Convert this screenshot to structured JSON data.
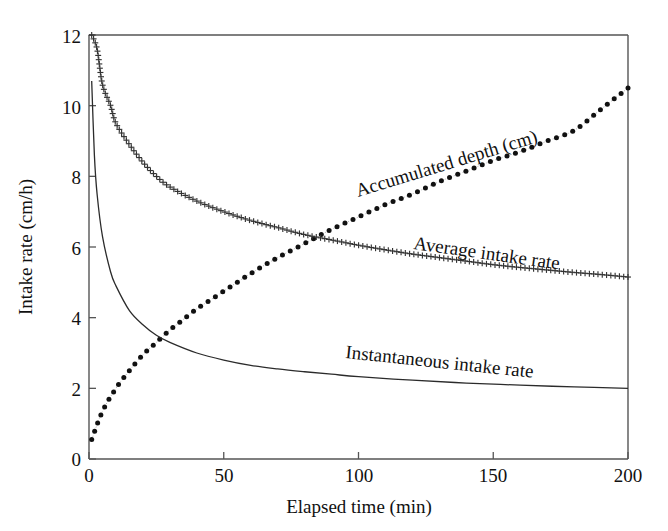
{
  "chart_data": {
    "type": "line",
    "title": "",
    "xlabel": "Elapsed time (min)",
    "ylabel": "Intake rate (cm/h)",
    "xlim": [
      0,
      200
    ],
    "ylim": [
      0,
      12
    ],
    "xticks": [
      "0",
      "50",
      "100",
      "150",
      "200"
    ],
    "yticks": [
      "0",
      "2",
      "4",
      "6",
      "8",
      "10",
      "12"
    ],
    "grid": false,
    "legend_position": "inline-curve-labels",
    "series": [
      {
        "name": "Accumulated depth (cm)",
        "marker": "filled-circle",
        "linestyle": "dotted",
        "color": "#111111",
        "label_angle_deg": -17,
        "x": [
          1,
          5,
          10,
          15,
          20,
          25,
          30,
          35,
          40,
          45,
          50,
          60,
          70,
          80,
          90,
          100,
          110,
          120,
          130,
          140,
          150,
          160,
          170,
          180,
          190,
          200
        ],
        "y": [
          0.55,
          1.35,
          2.0,
          2.5,
          2.95,
          3.3,
          3.65,
          3.95,
          4.25,
          4.5,
          4.75,
          5.25,
          5.7,
          6.1,
          6.5,
          6.85,
          7.2,
          7.5,
          7.85,
          8.15,
          8.45,
          8.7,
          9.0,
          9.3,
          9.9,
          10.5
        ]
      },
      {
        "name": "Average intake rate",
        "marker": "plus",
        "linestyle": "dotted",
        "color": "#333333",
        "label_angle_deg": 8,
        "x": [
          1,
          3,
          5,
          8,
          10,
          15,
          20,
          25,
          30,
          40,
          50,
          60,
          70,
          80,
          90,
          100,
          110,
          120,
          130,
          140,
          150,
          160,
          170,
          180,
          190,
          200
        ],
        "y": [
          12.0,
          11.6,
          10.6,
          10.0,
          9.5,
          8.9,
          8.4,
          8.0,
          7.7,
          7.3,
          7.0,
          6.75,
          6.55,
          6.35,
          6.2,
          6.05,
          5.92,
          5.8,
          5.7,
          5.6,
          5.5,
          5.42,
          5.35,
          5.28,
          5.22,
          5.15
        ]
      },
      {
        "name": "Instantaneous intake rate",
        "marker": "none",
        "linestyle": "solid",
        "color": "#2b2b2b",
        "label_angle_deg": 6,
        "x": [
          1,
          2,
          3,
          5,
          8,
          10,
          15,
          20,
          25,
          30,
          40,
          50,
          60,
          70,
          80,
          90,
          100,
          120,
          140,
          160,
          180,
          200
        ],
        "y": [
          10.7,
          8.6,
          7.5,
          6.3,
          5.3,
          4.9,
          4.2,
          3.8,
          3.5,
          3.3,
          3.0,
          2.8,
          2.65,
          2.55,
          2.47,
          2.4,
          2.33,
          2.23,
          2.15,
          2.09,
          2.04,
          2.0
        ]
      }
    ]
  },
  "labels": {
    "accumulated_depth": "Accumulated depth (cm)",
    "average_intake_rate": "Average intake rate",
    "instantaneous_intake_rate": "Instantaneous intake rate",
    "y_axis_title": "Intake rate (cm/h)",
    "x_axis_title": "Elapsed time (min)"
  },
  "axes": {
    "x_tick_0": "0",
    "x_tick_1": "50",
    "x_tick_2": "100",
    "x_tick_3": "150",
    "x_tick_4": "200",
    "y_tick_0": "0",
    "y_tick_1": "2",
    "y_tick_2": "4",
    "y_tick_3": "6",
    "y_tick_4": "8",
    "y_tick_5": "10",
    "y_tick_6": "12"
  },
  "colors": {
    "axis": "#555555",
    "accumulated": "#111111",
    "average": "#333333",
    "instantaneous": "#2b2b2b",
    "background": "#ffffff"
  }
}
